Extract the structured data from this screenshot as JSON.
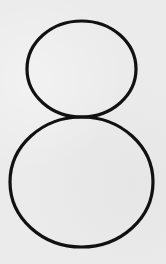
{
  "image": {
    "subject": "handwritten-style digit",
    "digit": "8",
    "description": "Black outline digit eight formed by two stacked ellipses on a light gray paper texture",
    "colors": {
      "background": "#ebebeb",
      "stroke": "#111111"
    }
  }
}
